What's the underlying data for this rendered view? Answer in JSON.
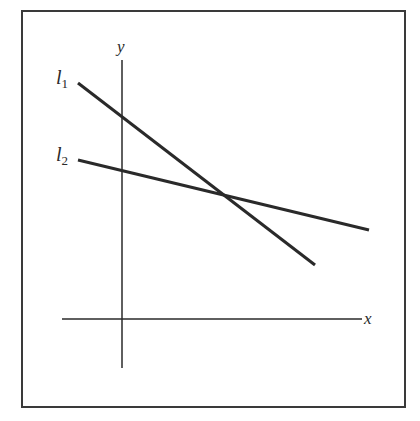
{
  "figure": {
    "frame": {
      "x": 22,
      "y": 11,
      "width": 383,
      "height": 396,
      "stroke": "#333333"
    },
    "axes": {
      "x_axis": {
        "label": "x",
        "x1": 62,
        "x2": 362,
        "y": 319
      },
      "y_axis": {
        "label": "y",
        "x": 122,
        "y1": 60,
        "y2": 368
      }
    },
    "lines": [
      {
        "name": "l1",
        "label_main": "l",
        "label_sub": "1",
        "x1": 78,
        "y1": 83,
        "x2": 315,
        "y2": 265
      },
      {
        "name": "l2",
        "label_main": "l",
        "label_sub": "2",
        "x1": 78,
        "y1": 160,
        "x2": 369,
        "y2": 230
      }
    ],
    "intersection": {
      "x": 225,
      "y": 196
    },
    "line_color": "#2a2a2a"
  }
}
